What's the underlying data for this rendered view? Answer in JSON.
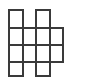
{
  "figure": {
    "name": "polyomino-grid-figure",
    "background_color": "#ffffff",
    "stroke_color": "#3a3a3a",
    "fill_color": "#ffffff",
    "stroke_width": 2,
    "canvas": {
      "width": 92,
      "height": 79
    },
    "grid": {
      "columns": 4,
      "rows": 4,
      "x_positions": [
        9,
        22.5,
        36,
        49.5,
        63,
        76.5
      ],
      "y_positions": [
        10,
        27.5,
        45,
        62,
        76
      ],
      "cell_width": 13.5,
      "cell_height": 17
    },
    "occupancy": [
      [
        1,
        0,
        1,
        0
      ],
      [
        1,
        1,
        1,
        1
      ],
      [
        1,
        1,
        1,
        1
      ],
      [
        1,
        0,
        1,
        0
      ]
    ],
    "cells": [
      {
        "row": 0,
        "col": 0,
        "x": 9,
        "y": 10,
        "w": 13.5,
        "h": 17.5
      },
      {
        "row": 0,
        "col": 2,
        "x": 36,
        "y": 10,
        "w": 13.5,
        "h": 17.5
      },
      {
        "row": 1,
        "col": 0,
        "x": 9,
        "y": 27.5,
        "w": 13.5,
        "h": 17.5
      },
      {
        "row": 1,
        "col": 1,
        "x": 22.5,
        "y": 27.5,
        "w": 13.5,
        "h": 17.5
      },
      {
        "row": 1,
        "col": 2,
        "x": 36,
        "y": 27.5,
        "w": 13.5,
        "h": 17.5
      },
      {
        "row": 1,
        "col": 3,
        "x": 49.5,
        "y": 27.5,
        "w": 13.5,
        "h": 17.5
      },
      {
        "row": 2,
        "col": 0,
        "x": 9,
        "y": 45,
        "w": 13.5,
        "h": 17
      },
      {
        "row": 2,
        "col": 1,
        "x": 22.5,
        "y": 45,
        "w": 13.5,
        "h": 17
      },
      {
        "row": 2,
        "col": 2,
        "x": 36,
        "y": 45,
        "w": 13.5,
        "h": 17
      },
      {
        "row": 2,
        "col": 3,
        "x": 49.5,
        "y": 45,
        "w": 13.5,
        "h": 17
      },
      {
        "row": 3,
        "col": 0,
        "x": 9,
        "y": 62,
        "w": 13.5,
        "h": 14
      },
      {
        "row": 3,
        "col": 2,
        "x": 36,
        "y": 62,
        "w": 13.5,
        "h": 14
      }
    ],
    "cell_count": 12
  }
}
